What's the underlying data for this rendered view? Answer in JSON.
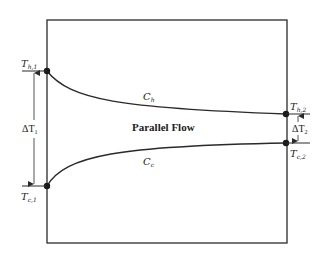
{
  "diagram": {
    "title": "Parallel Flow",
    "curves": {
      "hot": {
        "label": "C",
        "sub": "h"
      },
      "cold": {
        "label": "C",
        "sub": "c"
      }
    },
    "points": {
      "th1": {
        "label": "T",
        "sub": "h,1"
      },
      "tc1": {
        "label": "T",
        "sub": "c,1"
      },
      "th2": {
        "label": "T",
        "sub": "h,2"
      },
      "tc2": {
        "label": "T",
        "sub": "c,2"
      }
    },
    "deltas": {
      "dt1": {
        "label": "ΔT",
        "sub": "1"
      },
      "dt2": {
        "label": "ΔT",
        "sub": "2"
      }
    },
    "colors": {
      "line": "#2a2a2a",
      "background": "#ffffff"
    }
  }
}
